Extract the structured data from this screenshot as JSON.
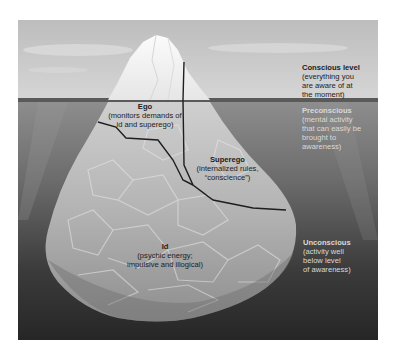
{
  "diagram": {
    "type": "iceberg-model",
    "levels": [
      {
        "id": "conscious",
        "title": "Conscious level",
        "description": "(everything you are aware of at the moment)"
      },
      {
        "id": "preconscious",
        "title": "Preconscious",
        "description": "(mental activity that can easily be brought to awareness)"
      },
      {
        "id": "unconscious",
        "title": "Unconscious",
        "description": "(activity well below level of awareness)"
      }
    ],
    "components": [
      {
        "id": "ego",
        "title": "Ego",
        "description": "(monitors demands of id and superego)"
      },
      {
        "id": "superego",
        "title": "Superego",
        "description": "(internalized rules, “conscience”)"
      },
      {
        "id": "id",
        "title": "Id",
        "description": "(psychic energy; impulsive and illogical)"
      }
    ]
  },
  "labels": {
    "conscious_title": "Conscious level",
    "conscious_desc_1": "(everything you",
    "conscious_desc_2": "are aware of at",
    "conscious_desc_3": "the moment)",
    "preconscious_title": "Preconscious",
    "preconscious_desc_1": "(mental activity",
    "preconscious_desc_2": "that can easily be",
    "preconscious_desc_3": "brought to",
    "preconscious_desc_4": "awareness)",
    "unconscious_title": "Unconscious",
    "unconscious_desc_1": "(activity well",
    "unconscious_desc_2": "below level",
    "unconscious_desc_3": "of awareness)",
    "ego_title": "Ego",
    "ego_desc_1": "(monitors demands of",
    "ego_desc_2": "id and superego)",
    "superego_title": "Superego",
    "superego_desc_1": "(internalized rules,",
    "superego_desc_2": "“conscience”)",
    "id_title": "Id",
    "id_desc_1": "(psychic energy;",
    "id_desc_2": "impulsive and illogical)"
  },
  "colors": {
    "sky": "#c9c9c9",
    "water_top": "#8a8a8a",
    "water_bottom": "#2b2b2b",
    "ice_above": "#f2f2f2",
    "ice_below": "#b8b8b8",
    "division_line": "#1e1e1e"
  }
}
